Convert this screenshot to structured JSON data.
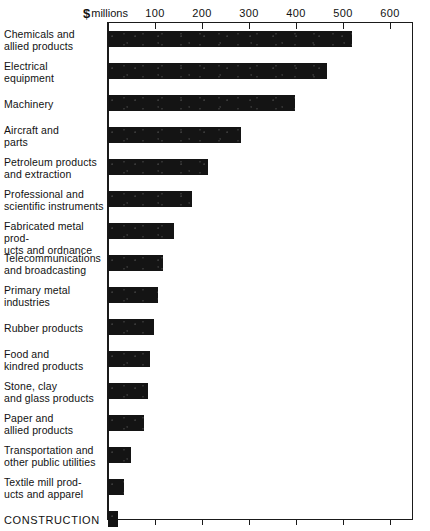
{
  "chart_data": {
    "type": "bar",
    "orientation": "horizontal",
    "title": "",
    "subtitle": "",
    "unit_caption": "millions",
    "currency_symbol": "$",
    "xlabel": "$ millions",
    "ylabel": "",
    "xlim": [
      0,
      650
    ],
    "grid": false,
    "legend": false,
    "tick_labels": [
      "100",
      "200",
      "300",
      "400",
      "500",
      "600"
    ],
    "ticks": [
      100,
      200,
      300,
      400,
      500,
      600
    ],
    "categories": [
      "Chemicals and allied products",
      "Electrical equipment",
      "Machinery",
      "Aircraft and parts",
      "Petroleum products and extraction",
      "Professional and scientific instruments",
      "Fabricated metal products and ordnance",
      "Telecommunications and broadcasting",
      "Primary metal industries",
      "Rubber products",
      "Food and kindred products",
      "Stone, clay and glass products",
      "Paper and allied products",
      "Transportation and other public utilities",
      "Textile mill products and apparel",
      "CONSTRUCTION"
    ],
    "values": [
      520,
      467,
      397,
      282,
      213,
      178,
      140,
      106,
      107,
      98,
      89,
      86,
      76,
      49,
      34,
      21
    ],
    "bar_color": "#141414"
  },
  "rows": [
    {
      "label_line1": "Chemicals and",
      "label_line2": "allied products",
      "value": 520
    },
    {
      "label_line1": "Electrical",
      "label_line2": "equipment",
      "value": 467
    },
    {
      "label_line1": "Machinery",
      "label_line2": "",
      "value": 397
    },
    {
      "label_line1": "Aircraft and",
      "label_line2": "parts",
      "value": 282
    },
    {
      "label_line1": "Petroleum products",
      "label_line2": "and extraction",
      "value": 213
    },
    {
      "label_line1": "Professional and",
      "label_line2": "scientific instruments",
      "value": 178
    },
    {
      "label_line1": "Fabricated metal prod-",
      "label_line2": "ucts and ordnance",
      "value": 140
    },
    {
      "label_line1": "Telecommunications",
      "label_line2": "and broadcasting",
      "value": 118
    },
    {
      "label_line1": "Primary metal",
      "label_line2": "industries",
      "value": 107
    },
    {
      "label_line1": "Rubber products",
      "label_line2": "",
      "value": 98
    },
    {
      "label_line1": "Food and",
      "label_line2": "kindred products",
      "value": 89
    },
    {
      "label_line1": "Stone, clay",
      "label_line2": "and glass products",
      "value": 86
    },
    {
      "label_line1": "Paper and",
      "label_line2": "allied products",
      "value": 76
    },
    {
      "label_line1": "Transportation and",
      "label_line2": "other public utilities",
      "value": 49
    },
    {
      "label_line1": "Textile mill prod-",
      "label_line2": "ucts and apparel",
      "value": 34
    },
    {
      "label_line1": "CONSTRUCTION",
      "label_line2": "",
      "value": 21
    }
  ]
}
